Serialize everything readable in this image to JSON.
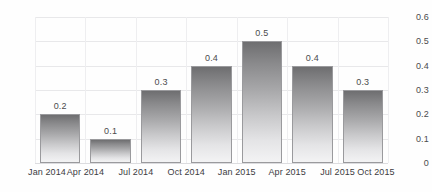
{
  "chart_data": {
    "type": "bar",
    "title": "",
    "subtitle": "",
    "xlabel": "",
    "ylabel": "",
    "categories": [
      "Jan 2014",
      "Apr 2014",
      "Jul 2014",
      "Oct 2014",
      "Jan 2015",
      "Apr 2015",
      "Jul 2015"
    ],
    "values": [
      0.2,
      0.1,
      0.3,
      0.4,
      0.5,
      0.4,
      0.3
    ],
    "data_labels": [
      "0.2",
      "0.1",
      "0.3",
      "0.4",
      "0.5",
      "0.4",
      "0.3"
    ],
    "x_tick_labels": [
      "Jan 2014",
      "Apr 2014",
      "Jul 2014",
      "Oct 2014",
      "Jan 2015",
      "Apr 2015",
      "Jul 2015",
      "Oct 2015"
    ],
    "y_tick_labels": [
      "0",
      "0.1",
      "0.2",
      "0.3",
      "0.4",
      "0.5",
      "0.6"
    ],
    "y_tick_values": [
      0,
      0.1,
      0.2,
      0.3,
      0.4,
      0.5,
      0.6
    ],
    "ylim": [
      0,
      0.6
    ],
    "y_axis_position": "right",
    "grid": true,
    "legend": false,
    "legend_position": "none",
    "colors": {
      "bar_top": "#6e6e70",
      "bar_bottom": "#f3f3f4",
      "bar_border": "#9a9a9d",
      "gridline": "#e8e8ea",
      "axis_text": "#3c3c3e",
      "background": "#fefefe"
    }
  }
}
